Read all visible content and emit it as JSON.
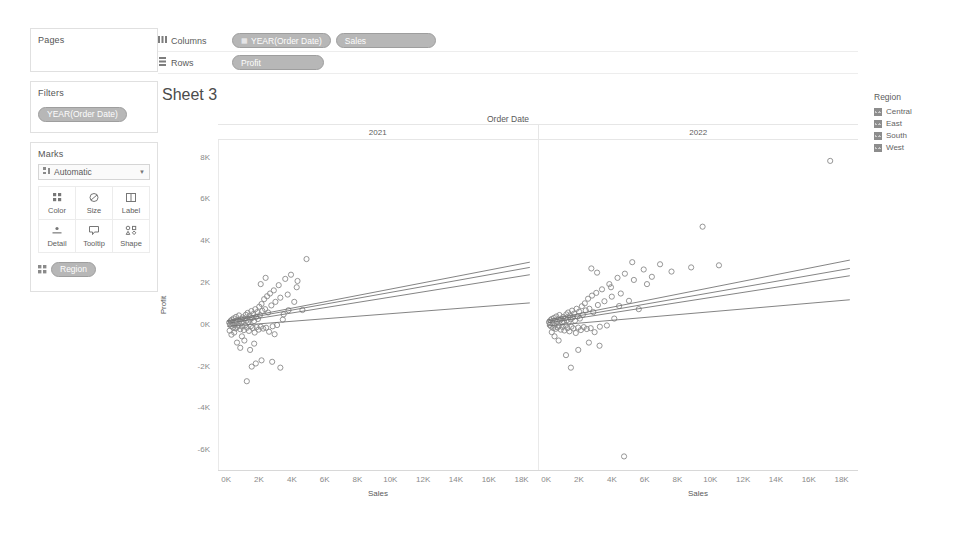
{
  "left_panel": {
    "pages": {
      "title": "Pages"
    },
    "filters": {
      "title": "Filters",
      "pills": [
        {
          "label": "YEAR(Order Date)"
        }
      ]
    },
    "marks": {
      "title": "Marks",
      "mark_type": "Automatic",
      "mark_type_icon": "automatic-icon",
      "buttons": [
        {
          "label": "Color",
          "icon": "color-icon"
        },
        {
          "label": "Size",
          "icon": "size-icon"
        },
        {
          "label": "Label",
          "icon": "label-icon"
        },
        {
          "label": "Detail",
          "icon": "detail-icon"
        },
        {
          "label": "Tooltip",
          "icon": "tooltip-icon"
        },
        {
          "label": "Shape",
          "icon": "shape-icon"
        }
      ],
      "encoding_pills": [
        {
          "shelf": "Color",
          "label": "Region"
        }
      ]
    }
  },
  "shelves": {
    "columns": {
      "label": "Columns",
      "pills": [
        {
          "label": "YEAR(Order Date)"
        },
        {
          "label": "Sales"
        }
      ]
    },
    "rows": {
      "label": "Rows",
      "pills": [
        {
          "label": "Profit"
        }
      ]
    }
  },
  "viz": {
    "sheet_title": "Sheet 3",
    "column_field_title": "Order Date",
    "panel_headers": [
      "2021",
      "2022"
    ]
  },
  "legend": {
    "title": "Region",
    "items": [
      {
        "label": "Central",
        "color": "#8d8d8d"
      },
      {
        "label": "East",
        "color": "#8d8d8d"
      },
      {
        "label": "South",
        "color": "#8d8d8d"
      },
      {
        "label": "West",
        "color": "#8d8d8d"
      }
    ]
  },
  "chart_data": {
    "type": "scatter",
    "title": "Sheet 3",
    "xlabel": "Sales",
    "ylabel": "Profit",
    "xlim": [
      -500,
      19000
    ],
    "ylim": [
      -7000,
      8800
    ],
    "xticks": [
      "0K",
      "2K",
      "4K",
      "6K",
      "8K",
      "10K",
      "12K",
      "14K",
      "16K",
      "18K"
    ],
    "xtick_values": [
      0,
      2000,
      4000,
      6000,
      8000,
      10000,
      12000,
      14000,
      16000,
      18000
    ],
    "yticks": [
      "8K",
      "6K",
      "4K",
      "2K",
      "0K",
      "-2K",
      "-4K",
      "-6K"
    ],
    "ytick_values": [
      8000,
      6000,
      4000,
      2000,
      0,
      -2000,
      -4000,
      -6000
    ],
    "grid": false,
    "legend_position": "right",
    "facet_field": "Order Date",
    "color_field": "Region",
    "facets": [
      {
        "name": "2021",
        "trendlines": [
          {
            "series": "Central",
            "x0": 0,
            "y0": 150,
            "x1": 18500,
            "y1": 2950
          },
          {
            "series": "East",
            "x0": 0,
            "y0": 100,
            "x1": 18500,
            "y1": 2700
          },
          {
            "series": "South",
            "x0": 0,
            "y0": 20,
            "x1": 18500,
            "y1": 2350
          },
          {
            "series": "West",
            "x0": 0,
            "y0": -120,
            "x1": 18500,
            "y1": 1000
          }
        ],
        "points": [
          [
            120,
            60
          ],
          [
            180,
            -40
          ],
          [
            210,
            140
          ],
          [
            250,
            -110
          ],
          [
            290,
            200
          ],
          [
            320,
            30
          ],
          [
            360,
            -180
          ],
          [
            400,
            260
          ],
          [
            430,
            -60
          ],
          [
            470,
            120
          ],
          [
            510,
            -220
          ],
          [
            540,
            330
          ],
          [
            580,
            80
          ],
          [
            610,
            -150
          ],
          [
            650,
            190
          ],
          [
            690,
            -90
          ],
          [
            720,
            400
          ],
          [
            760,
            140
          ],
          [
            800,
            -260
          ],
          [
            840,
            220
          ],
          [
            870,
            60
          ],
          [
            910,
            -130
          ],
          [
            950,
            310
          ],
          [
            990,
            100
          ],
          [
            1020,
            -300
          ],
          [
            1060,
            250
          ],
          [
            1100,
            -70
          ],
          [
            1140,
            430
          ],
          [
            1180,
            150
          ],
          [
            1210,
            -190
          ],
          [
            1250,
            520
          ],
          [
            1290,
            90
          ],
          [
            1330,
            -340
          ],
          [
            1370,
            380
          ],
          [
            1400,
            200
          ],
          [
            1440,
            -120
          ],
          [
            1480,
            610
          ],
          [
            1520,
            280
          ],
          [
            1560,
            -200
          ],
          [
            1600,
            470
          ],
          [
            1640,
            130
          ],
          [
            1680,
            -420
          ],
          [
            1720,
            700
          ],
          [
            1760,
            330
          ],
          [
            1800,
            -160
          ],
          [
            1840,
            560
          ],
          [
            1880,
            230
          ],
          [
            1920,
            -280
          ],
          [
            1960,
            820
          ],
          [
            2000,
            410
          ],
          [
            2050,
            -140
          ],
          [
            2100,
            950
          ],
          [
            2150,
            620
          ],
          [
            2200,
            -230
          ],
          [
            2260,
            1180
          ],
          [
            2320,
            700
          ],
          [
            2380,
            -190
          ],
          [
            2440,
            1320
          ],
          [
            2500,
            540
          ],
          [
            2560,
            -380
          ],
          [
            2620,
            1450
          ],
          [
            2700,
            880
          ],
          [
            2780,
            -120
          ],
          [
            2850,
            1600
          ],
          [
            2950,
            1050
          ],
          [
            3050,
            -60
          ],
          [
            3150,
            1850
          ],
          [
            3250,
            1250
          ],
          [
            3400,
            200
          ],
          [
            3550,
            2150
          ],
          [
            3700,
            1400
          ],
          [
            3900,
            2350
          ],
          [
            4100,
            1050
          ],
          [
            4300,
            2050
          ],
          [
            4600,
            660
          ],
          [
            4850,
            3100
          ],
          [
            1500,
            -2050
          ],
          [
            1750,
            -1900
          ],
          [
            2100,
            -1750
          ],
          [
            1200,
            -2750
          ],
          [
            2750,
            -1820
          ],
          [
            3250,
            -2100
          ],
          [
            600,
            -900
          ],
          [
            800,
            -1150
          ],
          [
            1050,
            -800
          ],
          [
            1400,
            -1250
          ],
          [
            900,
            -600
          ],
          [
            1650,
            -950
          ],
          [
            430,
            -420
          ],
          [
            260,
            -520
          ],
          [
            150,
            -330
          ],
          [
            3750,
            650
          ],
          [
            2900,
            -500
          ],
          [
            3450,
            450
          ],
          [
            4250,
            1750
          ],
          [
            2050,
            1900
          ],
          [
            2350,
            2200
          ]
        ]
      },
      {
        "name": "2022",
        "trendlines": [
          {
            "series": "Central",
            "x0": 0,
            "y0": 180,
            "x1": 18500,
            "y1": 3050
          },
          {
            "series": "East",
            "x0": 0,
            "y0": 120,
            "x1": 18500,
            "y1": 2650
          },
          {
            "series": "South",
            "x0": 0,
            "y0": 40,
            "x1": 18500,
            "y1": 2300
          },
          {
            "series": "West",
            "x0": 0,
            "y0": -100,
            "x1": 18500,
            "y1": 1150
          }
        ],
        "points": [
          [
            110,
            80
          ],
          [
            160,
            -60
          ],
          [
            200,
            170
          ],
          [
            240,
            -130
          ],
          [
            280,
            230
          ],
          [
            330,
            40
          ],
          [
            370,
            -200
          ],
          [
            410,
            280
          ],
          [
            450,
            -80
          ],
          [
            490,
            150
          ],
          [
            520,
            -240
          ],
          [
            560,
            350
          ],
          [
            600,
            90
          ],
          [
            640,
            -170
          ],
          [
            680,
            210
          ],
          [
            710,
            -100
          ],
          [
            750,
            420
          ],
          [
            790,
            160
          ],
          [
            830,
            -280
          ],
          [
            860,
            240
          ],
          [
            900,
            70
          ],
          [
            940,
            -150
          ],
          [
            980,
            330
          ],
          [
            1010,
            110
          ],
          [
            1050,
            -320
          ],
          [
            1090,
            270
          ],
          [
            1130,
            -80
          ],
          [
            1170,
            450
          ],
          [
            1200,
            170
          ],
          [
            1240,
            -210
          ],
          [
            1280,
            540
          ],
          [
            1320,
            100
          ],
          [
            1360,
            -360
          ],
          [
            1400,
            400
          ],
          [
            1440,
            220
          ],
          [
            1480,
            -140
          ],
          [
            1520,
            630
          ],
          [
            1560,
            300
          ],
          [
            1600,
            -220
          ],
          [
            1650,
            490
          ],
          [
            1700,
            150
          ],
          [
            1750,
            -440
          ],
          [
            1800,
            720
          ],
          [
            1850,
            350
          ],
          [
            1900,
            -180
          ],
          [
            1950,
            580
          ],
          [
            2000,
            250
          ],
          [
            2060,
            -300
          ],
          [
            2120,
            840
          ],
          [
            2180,
            430
          ],
          [
            2240,
            -160
          ],
          [
            2300,
            980
          ],
          [
            2360,
            640
          ],
          [
            2420,
            -250
          ],
          [
            2500,
            1200
          ],
          [
            2580,
            720
          ],
          [
            2660,
            -210
          ],
          [
            2740,
            1350
          ],
          [
            2820,
            560
          ],
          [
            2900,
            -400
          ],
          [
            3000,
            1480
          ],
          [
            3100,
            900
          ],
          [
            3220,
            -140
          ],
          [
            3350,
            1650
          ],
          [
            3500,
            1080
          ],
          [
            3650,
            -80
          ],
          [
            3800,
            1900
          ],
          [
            3950,
            1300
          ],
          [
            4100,
            250
          ],
          [
            4300,
            2200
          ],
          [
            4500,
            1450
          ],
          [
            4750,
            2400
          ],
          [
            5000,
            1100
          ],
          [
            5300,
            2100
          ],
          [
            5600,
            700
          ],
          [
            5900,
            2600
          ],
          [
            6400,
            2250
          ],
          [
            6900,
            2850
          ],
          [
            7600,
            2500
          ],
          [
            9500,
            4650
          ],
          [
            17300,
            7800
          ],
          [
            4700,
            -6350
          ],
          [
            1450,
            -2100
          ],
          [
            1900,
            -1250
          ],
          [
            2550,
            -900
          ],
          [
            3200,
            -1050
          ],
          [
            1150,
            -1500
          ],
          [
            700,
            -800
          ],
          [
            450,
            -600
          ],
          [
            280,
            -400
          ],
          [
            3900,
            1750
          ],
          [
            4400,
            850
          ],
          [
            5200,
            2950
          ],
          [
            6100,
            1900
          ],
          [
            3050,
            2450
          ],
          [
            2700,
            2650
          ],
          [
            8800,
            2700
          ],
          [
            10500,
            2800
          ]
        ]
      }
    ]
  }
}
